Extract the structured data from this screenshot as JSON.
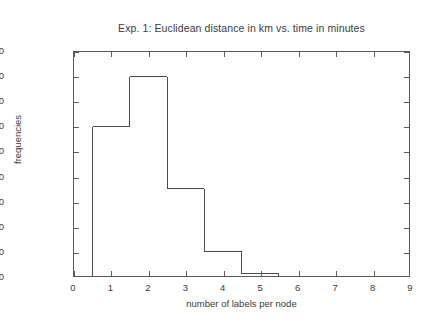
{
  "chart_data": {
    "type": "bar",
    "title": "Exp. 1: Euclidean distance in km vs. time in minutes",
    "xlabel": "number of labels per node",
    "ylabel": "frequencies",
    "grid": false,
    "legend": null,
    "xlim": [
      0,
      9
    ],
    "ylim": [
      0,
      450000
    ],
    "xticks": [
      0,
      1,
      2,
      3,
      4,
      5,
      6,
      7,
      8,
      9
    ],
    "xtick_labels": [
      "0",
      "1",
      "2",
      "3",
      "4",
      "5",
      "6",
      "7",
      "8",
      "9"
    ],
    "yticks": [
      0,
      50000,
      100000,
      150000,
      200000,
      250000,
      300000,
      350000,
      400000,
      450000
    ],
    "ytick_labels": [
      "0",
      "50000",
      "100000",
      "150000",
      "200000",
      "250000",
      "300000",
      "350000",
      "400000",
      "450000"
    ],
    "bin_edges": [
      0.5,
      1.5,
      2.5,
      3.5,
      4.5,
      5.5,
      6.5,
      7.5,
      8.5
    ],
    "categories": [
      "1",
      "2",
      "3",
      "4",
      "5",
      "6",
      "7",
      "8"
    ],
    "values": [
      300000,
      400000,
      175000,
      50000,
      5000,
      0,
      0,
      0
    ],
    "style": "step-outline",
    "line_color": "#4a4a4a",
    "fill": "none"
  },
  "figure": {
    "background": "#ffffff",
    "frame_color": "#5a5a5a"
  }
}
